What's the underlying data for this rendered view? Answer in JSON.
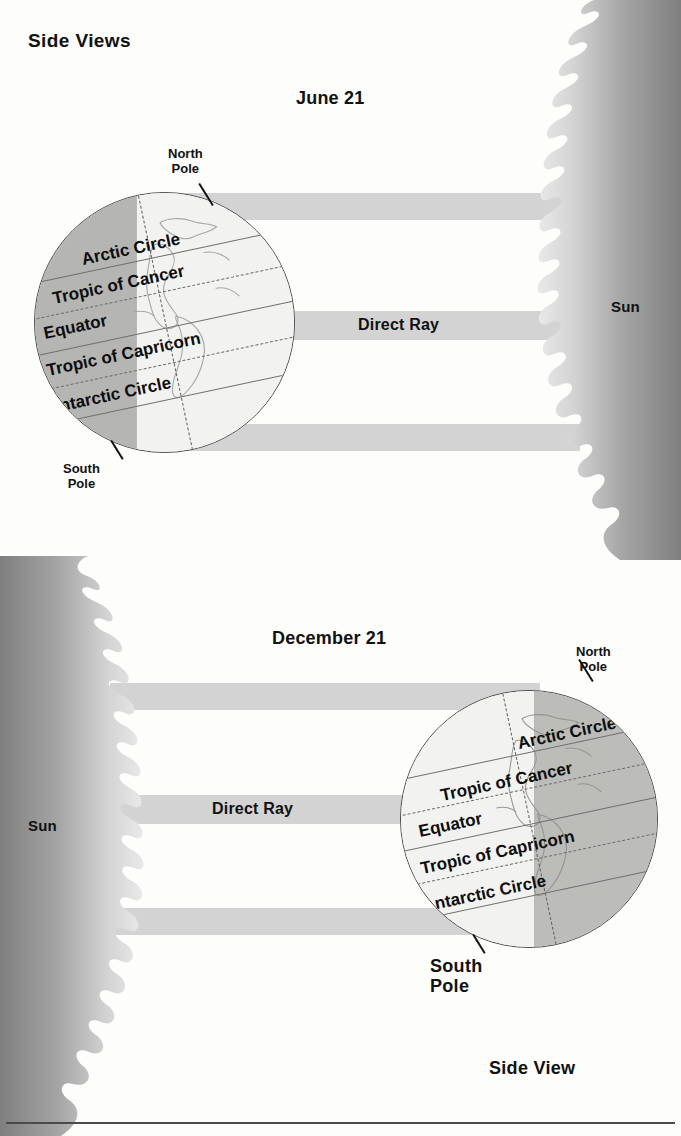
{
  "page": {
    "title": "Side Views",
    "footer_label": "Side View",
    "background": "#ffffff",
    "ray_color": "#d2d3d2",
    "sun_color_dark": "#8e8e8e",
    "sun_color_light": "#e9e9e9",
    "globe_lit_color": "#efefee",
    "globe_dark_color": "#b7b7b5"
  },
  "diagrams": [
    {
      "id": "june",
      "date_label": "June 21",
      "sun": {
        "label": "Sun",
        "side": "right"
      },
      "globe": {
        "side": "left",
        "tilt_note": "north pole tilted toward sun",
        "north_pole_label": "North\nPole",
        "south_pole_label": "South\nPole",
        "latitudes": [
          "Arctic Circle",
          "Tropic of Cancer",
          "Equator",
          "Tropic of Capricorn",
          "Antarctic Circle"
        ]
      },
      "rays": [
        {
          "name": "upper-ray",
          "label": ""
        },
        {
          "name": "direct-ray",
          "label": "Direct Ray"
        },
        {
          "name": "lower-ray",
          "label": ""
        }
      ]
    },
    {
      "id": "december",
      "date_label": "December 21",
      "sun": {
        "label": "Sun",
        "side": "left"
      },
      "globe": {
        "side": "right",
        "tilt_note": "north pole tilted away from sun",
        "north_pole_label": "North\nPole",
        "south_pole_label": "South\nPole",
        "latitudes": [
          "Arctic Circle",
          "Tropic of Cancer",
          "Equator",
          "Tropic of Capricorn",
          "Antarctic Circle"
        ]
      },
      "rays": [
        {
          "name": "upper-ray",
          "label": ""
        },
        {
          "name": "direct-ray",
          "label": "Direct Ray"
        },
        {
          "name": "lower-ray",
          "label": ""
        }
      ]
    }
  ]
}
